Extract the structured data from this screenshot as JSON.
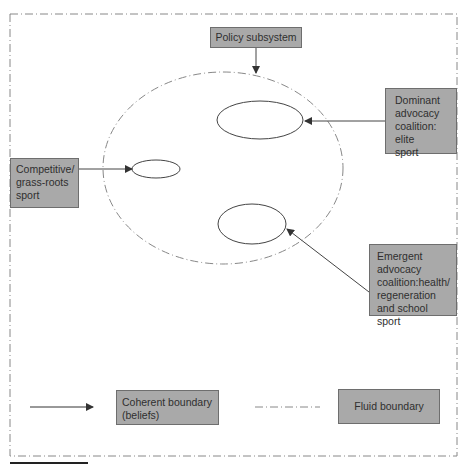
{
  "diagram": {
    "colors": {
      "box_fill": "#a9a9a9",
      "box_border": "#6e6e6e",
      "line": "#444444",
      "dashed_line": "#888888",
      "background": "#ffffff"
    },
    "nodes": {
      "policy_subsystem": "Policy subsystem",
      "dominant_coalition": "Dominant\nadvocacy\ncoalition: elite\nsport",
      "competitive": "Competitive/\ngrass-roots\nsport",
      "emergent_coalition": "Emergent\nadvocacy\ncoalition:health/\nregeneration\nand school sport"
    },
    "legend": {
      "coherent_label": "Coherent boundary\n(beliefs)",
      "fluid_label": "Fluid boundary"
    },
    "edges": [
      {
        "from": "policy_subsystem",
        "to": "fluid-boundary-ellipse"
      },
      {
        "from": "dominant_coalition",
        "to": "top-oval"
      },
      {
        "from": "competitive",
        "to": "left-oval"
      },
      {
        "from": "emergent_coalition",
        "to": "bottom-oval"
      }
    ]
  }
}
